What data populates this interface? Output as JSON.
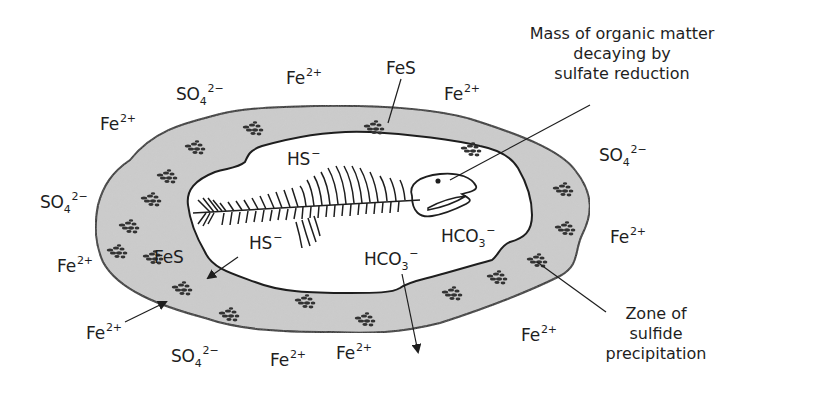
{
  "figure": {
    "colors": {
      "zone_fill": "#c9c9c9",
      "outline": "#1e1e1e",
      "background": "#ffffff",
      "text": "#1e1e1e"
    }
  },
  "callouts": {
    "organic_matter": {
      "line1": "Mass of organic matter",
      "line2": "decaying by",
      "line3": "sulfate reduction"
    },
    "zone": {
      "line1": "Zone of",
      "line2": "sulfide",
      "line3": "precipitation"
    }
  },
  "ions": {
    "fe": {
      "base": "Fe",
      "charge": "2+"
    },
    "so4": {
      "base": "SO",
      "sub": "4",
      "charge": "2−"
    },
    "hs": {
      "base": "HS",
      "charge": "−"
    },
    "hco3": {
      "base": "HCO",
      "sub": "3",
      "charge": "−"
    },
    "fes": {
      "base": "FeS"
    }
  },
  "labels": {
    "fe_top_left": "Fe",
    "so4_top": "SO",
    "fe_top_center": "Fe",
    "fes_top": "FeS",
    "fe_top_right": "Fe",
    "so4_right": "SO",
    "fe_right": "Fe",
    "so4_left": "SO",
    "fe_left": "Fe",
    "fes_inner": "FeS",
    "fe_bottom_left": "Fe",
    "so4_bottom": "SO",
    "fe_bottom_1": "Fe",
    "fe_bottom_2": "Fe",
    "fe_bottom_right": "Fe",
    "hs_top": "HS",
    "hs_inner": "HS",
    "hco3_right": "HCO",
    "hco3_center": "HCO"
  }
}
